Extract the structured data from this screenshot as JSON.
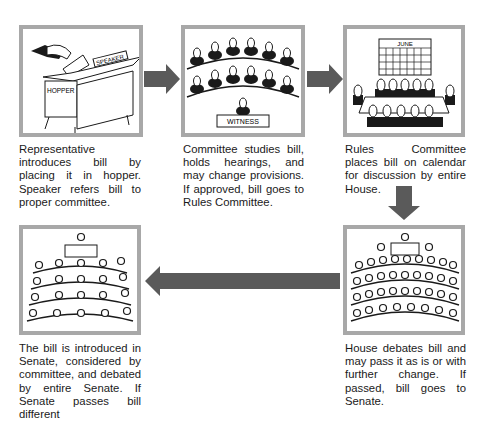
{
  "colors": {
    "frame": "#a8a8a8",
    "arrow": "#5a5a5a",
    "ink": "#1a1a1a"
  },
  "steps": [
    {
      "labels": [
        "SPEAKER",
        "HOPPER"
      ],
      "caption": "Representative introduces bill by placing it in hopper. Speaker refers bill to proper committee."
    },
    {
      "labels": [
        "WITNESS"
      ],
      "caption": "Committee studies bill, holds hearings, and may change provisions. If approved, bill goes to Rules Committee."
    },
    {
      "labels": [
        "JUNE"
      ],
      "caption": "Rules Committee places bill on calendar for discussion by entire House."
    },
    {
      "labels": [],
      "caption": "House debates bill and may pass it as is or with further change. If passed, bill goes to Senate."
    },
    {
      "labels": [],
      "caption": "The bill is introduced in Senate, considered by committee, and debated by entire Senate. If Senate passes bill different"
    }
  ],
  "arrows": [
    "right",
    "right",
    "down",
    "left"
  ]
}
